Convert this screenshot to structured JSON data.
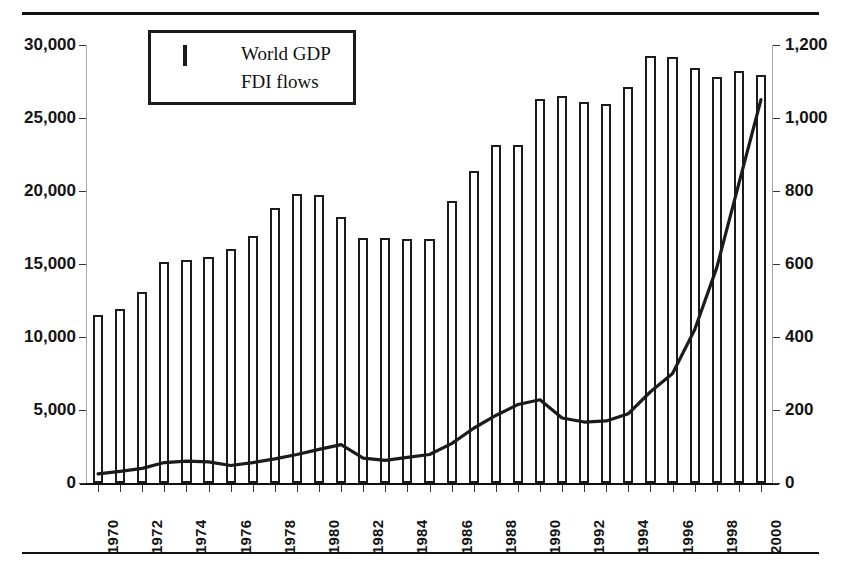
{
  "figure": {
    "clipped_header_fragment": "",
    "rules": {
      "top": true,
      "bottom": true
    }
  },
  "legend": {
    "position": "inside-top-left",
    "entries": [
      {
        "label": "World GDP",
        "marker": "bar-outline",
        "icon": "legend-box-icon"
      },
      {
        "label": "FDI flows",
        "marker": "line",
        "icon": "legend-line-icon"
      }
    ]
  },
  "chart_data": {
    "type": "bar",
    "title": "",
    "subtitle": "",
    "xlabel": "",
    "ylabel": "",
    "y2label": "",
    "grid": false,
    "legend_position": "top-left-inside",
    "axis": {
      "x_categories_all": [
        "1970",
        "1971",
        "1972",
        "1973",
        "1974",
        "1975",
        "1976",
        "1977",
        "1978",
        "1979",
        "1980",
        "1981",
        "1982",
        "1983",
        "1984",
        "1985",
        "1986",
        "1987",
        "1988",
        "1989",
        "1990",
        "1991",
        "1992",
        "1993",
        "1994",
        "1995",
        "1996",
        "1997",
        "1998",
        "1999",
        "2000"
      ],
      "x_tick_labels_shown": [
        "1970",
        "1972",
        "1974",
        "1976",
        "1978",
        "1980",
        "1982",
        "1984",
        "1986",
        "1988",
        "1990",
        "1992",
        "1994",
        "1996",
        "1998",
        "2000"
      ],
      "ylim": [
        0,
        30000
      ],
      "y_ticks": [
        0,
        5000,
        10000,
        15000,
        20000,
        25000,
        30000
      ],
      "y_tick_labels": [
        "0",
        "5,000",
        "10,000",
        "15,000",
        "20,000",
        "25,000",
        "30,000"
      ],
      "y2lim": [
        0,
        1200
      ],
      "y2_ticks": [
        0,
        200,
        400,
        600,
        800,
        1000,
        1200
      ],
      "y2_tick_labels": [
        "0",
        "200",
        "400",
        "600",
        "800",
        "1,000",
        "1,200"
      ],
      "y2_tick_labels_clipped": [
        "0",
        "200",
        "400",
        "600",
        "800",
        "1,00C",
        "1,20C"
      ]
    },
    "series": [
      {
        "name": "World GDP",
        "kind": "bar",
        "axis": "left",
        "values": [
          11500,
          11950,
          13050,
          15150,
          15300,
          15500,
          16000,
          16950,
          18850,
          19800,
          19700,
          18200,
          16750,
          16800,
          16700,
          16700,
          19350,
          21400,
          23150,
          23150,
          26300,
          26500,
          26100,
          25950,
          27100,
          29250,
          29200,
          28450,
          27800,
          28250,
          27950
        ]
      },
      {
        "name": "FDI flows",
        "kind": "line",
        "axis": "right",
        "values": [
          25,
          32,
          40,
          56,
          60,
          58,
          48,
          56,
          66,
          78,
          92,
          105,
          68,
          62,
          70,
          78,
          108,
          150,
          185,
          215,
          228,
          178,
          167,
          170,
          190,
          250,
          300,
          420,
          590,
          820,
          1050
        ]
      }
    ]
  }
}
